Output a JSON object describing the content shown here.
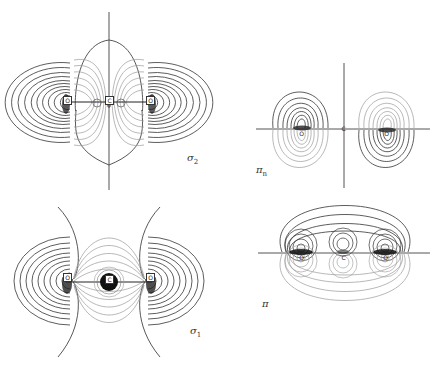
{
  "figure": {
    "panels": [
      {
        "id": "sigma2",
        "label": {
          "symbol": "σ",
          "subscript": "2"
        },
        "atoms": [
          "O",
          "C",
          "O"
        ]
      },
      {
        "id": "pi-n",
        "label": {
          "symbol": "π",
          "subscript": "n"
        },
        "atoms": [
          "O",
          "C",
          "O"
        ]
      },
      {
        "id": "sigma1",
        "label": {
          "symbol": "σ",
          "subscript": "1"
        },
        "atoms": [
          "O",
          "C",
          "O"
        ]
      },
      {
        "id": "pi",
        "label": {
          "symbol": "π",
          "subscript": ""
        },
        "atoms": [
          "O",
          "C",
          "O"
        ]
      }
    ]
  },
  "colors": {
    "background": "#ffffff",
    "contour_dark": "#333333",
    "contour_light": "#999999",
    "axis": "#555555"
  }
}
